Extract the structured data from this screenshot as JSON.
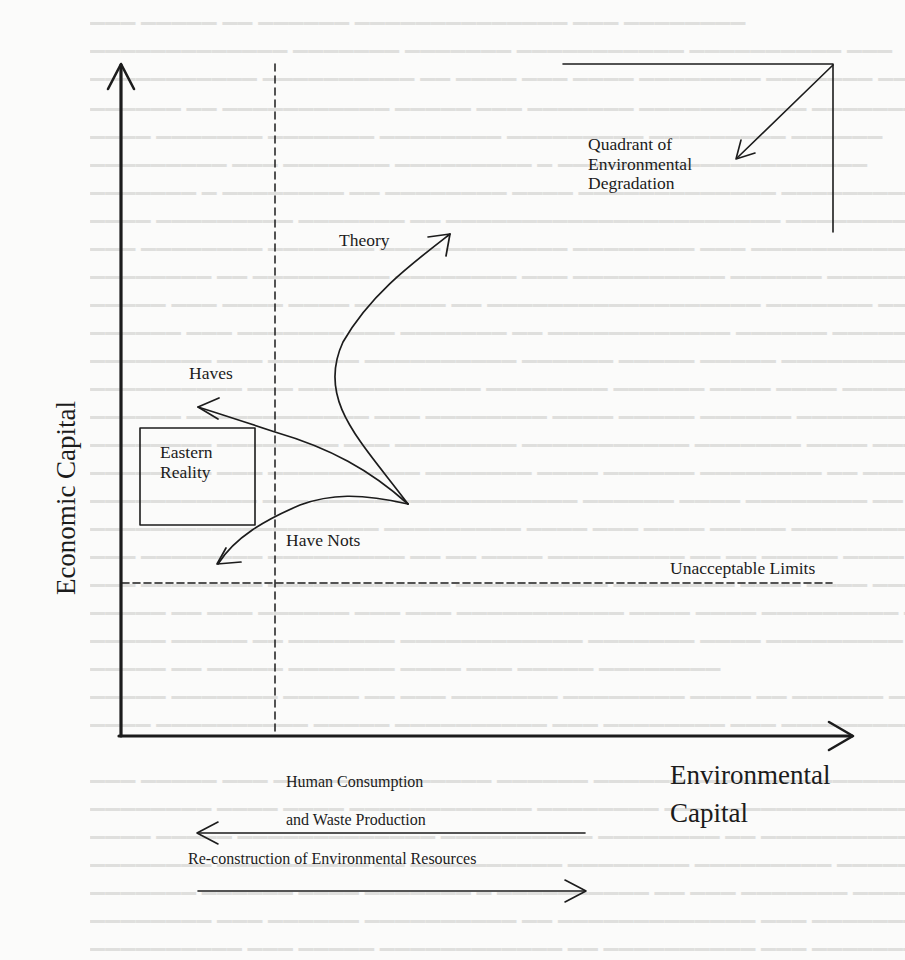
{
  "diagram": {
    "axes": {
      "y_label": "Economic Capital",
      "x_label_line1": "Environmental",
      "x_label_line2": "Capital"
    },
    "regions": {
      "quadrant_line1": "Quadrant of",
      "quadrant_line2": "Environmental",
      "quadrant_line3": "Degradation",
      "box_line1": "Eastern",
      "box_line2": "Reality"
    },
    "curves": {
      "theory": "Theory",
      "haves": "Haves",
      "have_nots": "Have Nots"
    },
    "thresholds": {
      "unacceptable_limits": "Unacceptable Limits"
    },
    "flows": {
      "consumption_line1": "Human Consumption",
      "consumption_line2": "and Waste Production",
      "reconstruction": "Re-construction of Environmental Resources"
    },
    "colors": {
      "ink": "#1c1c1c",
      "paper": "#fbfbfa",
      "bleed_through": "#c9c9c7"
    }
  }
}
